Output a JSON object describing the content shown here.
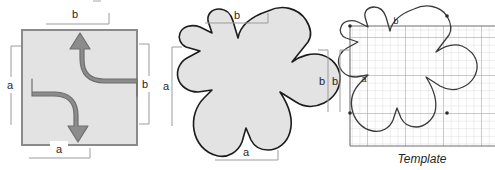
{
  "figure": {
    "caption": "Template",
    "panels": [
      {
        "name": "square-panel",
        "kind": "square-with-arrows",
        "dimension_labels": {
          "top": "b",
          "left": "a",
          "right": "b",
          "bottom": "a"
        },
        "arrows": [
          {
            "name": "arrow-up-right",
            "direction": "up"
          },
          {
            "name": "arrow-left-down",
            "direction": "down"
          }
        ]
      },
      {
        "name": "tile-panel",
        "kind": "escher-tile",
        "dimension_labels": {
          "top": "b",
          "left": "a",
          "right": "b",
          "bottom": "a"
        }
      },
      {
        "name": "template-panel",
        "kind": "escher-tile-on-grid",
        "dimension_labels": {
          "left": "b",
          "tile_top": "b",
          "tile_left": "a"
        }
      }
    ]
  },
  "colors": {
    "shape_fill": "#e3e3e3",
    "shape_stroke": "#1c1c1c",
    "square_stroke": "#8a8a8a",
    "arrow_fill": "#8c8c8c",
    "arrow_stroke": "#6e6e6e",
    "grid_minor": "#c9c9c9",
    "grid_major": "#9a9a9a",
    "dim_line": "#9b9b9b",
    "text": "#262626"
  }
}
